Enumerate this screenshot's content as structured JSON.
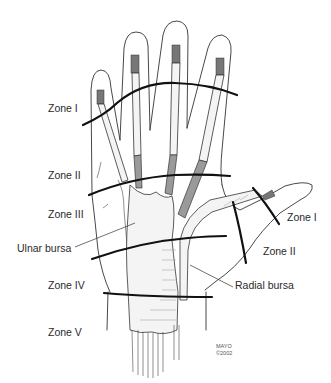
{
  "figure": {
    "zone_labels_fingers": [
      {
        "label": "Zone I",
        "x": 48,
        "y": 103
      },
      {
        "label": "Zone II",
        "x": 48,
        "y": 170
      },
      {
        "label": "Zone III",
        "x": 48,
        "y": 209
      },
      {
        "label": "Zone IV",
        "x": 48,
        "y": 280
      },
      {
        "label": "Zone V",
        "x": 48,
        "y": 327
      }
    ],
    "zone_labels_thumb": [
      {
        "label": "Zone I",
        "x": 287,
        "y": 216
      },
      {
        "label": "Zone II",
        "x": 263,
        "y": 250
      }
    ],
    "bursa_labels": [
      {
        "label": "Ulnar bursa",
        "x": 17,
        "y": 245
      },
      {
        "label": "Radial bursa",
        "x": 235,
        "y": 284
      }
    ],
    "credit": {
      "line1": "MAYO",
      "line2": "©2002"
    },
    "colors": {
      "line": "#111111",
      "outline": "#333333",
      "text": "#2a2a2a",
      "background": "#ffffff"
    }
  }
}
